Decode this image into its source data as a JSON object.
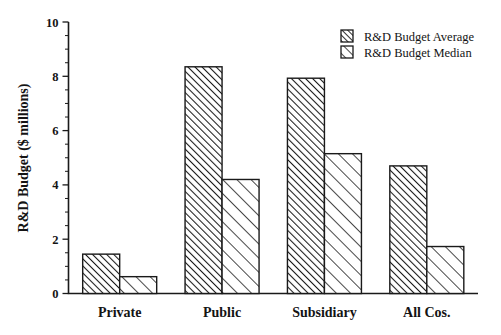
{
  "chart_data": {
    "type": "bar",
    "title": "",
    "xlabel": "",
    "ylabel": "R&D Budget ($ millions)",
    "categories": [
      "Private",
      "Public",
      "Subsidiary",
      "All Cos."
    ],
    "series": [
      {
        "name": "R&D Budget Average",
        "values": [
          1.45,
          8.35,
          7.93,
          4.7
        ]
      },
      {
        "name": "R&D Budget Median",
        "values": [
          0.62,
          4.2,
          5.15,
          1.73
        ]
      }
    ],
    "ylim": [
      0,
      10
    ],
    "ytick_labels": [
      "0",
      "2",
      "4",
      "6",
      "8",
      "10"
    ],
    "ytick_values": [
      0,
      2,
      4,
      6,
      8,
      10
    ],
    "yminor_step": 0.5,
    "grid": false,
    "legend_position": "top-right",
    "colors": {
      "axis": "#1a1a1a",
      "bar_outline": "#1a1a1a",
      "bar_fill": "#ffffff",
      "hatch": "#1a1a1a",
      "background": "#ffffff"
    }
  },
  "legend": {
    "items": [
      {
        "label": "R&D Budget Average",
        "swatch": "hatch-dense-icon"
      },
      {
        "label": "R&D Budget Median",
        "swatch": "hatch-sparse-icon"
      }
    ]
  },
  "axes": {
    "y_title": "R&D Budget ($ millions)",
    "y_ticks": [
      "0",
      "2",
      "4",
      "6",
      "8",
      "10"
    ],
    "x_ticks": [
      "Private",
      "Public",
      "Subsidiary",
      "All Cos."
    ]
  }
}
